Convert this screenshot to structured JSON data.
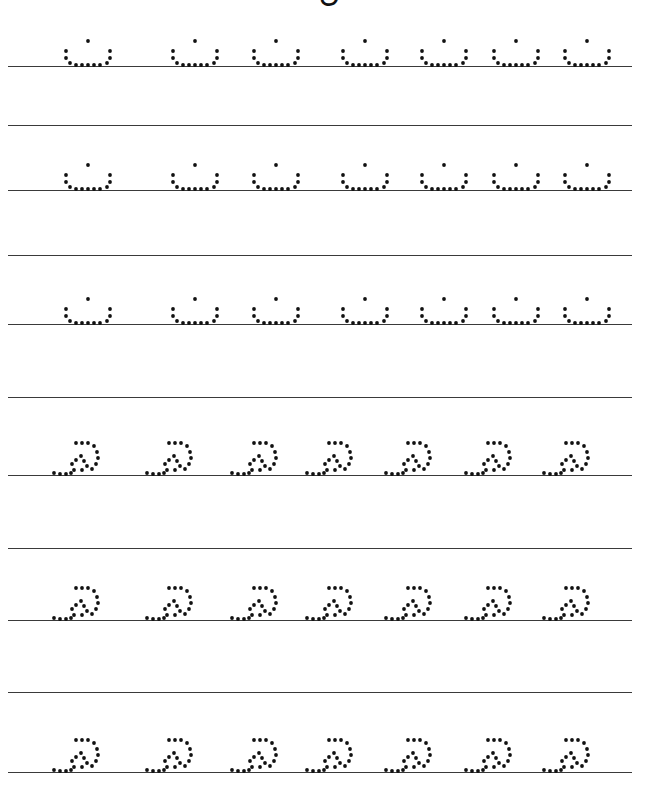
{
  "worksheet": {
    "title": "ن",
    "ink_color": "#111111",
    "rule_color": "#3a3a3a",
    "rule_lines_y": [
      66,
      125,
      190,
      255,
      324,
      397,
      475,
      548,
      620,
      692,
      772
    ],
    "rows": [
      {
        "glyph": "noon",
        "baseline_y": 66,
        "glyph_x": [
          62,
          169,
          250,
          339,
          418,
          490,
          561
        ]
      },
      {
        "glyph": "noon",
        "baseline_y": 190,
        "glyph_x": [
          62,
          169,
          250,
          339,
          418,
          490,
          561
        ]
      },
      {
        "glyph": "noon",
        "baseline_y": 324,
        "glyph_x": [
          62,
          169,
          250,
          339,
          418,
          490,
          561
        ]
      },
      {
        "glyph": "swirl",
        "baseline_y": 475,
        "glyph_x": [
          52,
          145,
          230,
          305,
          384,
          464,
          542
        ]
      },
      {
        "glyph": "swirl",
        "baseline_y": 620,
        "glyph_x": [
          52,
          145,
          230,
          305,
          384,
          464,
          542
        ]
      },
      {
        "glyph": "swirl",
        "baseline_y": 772,
        "glyph_x": [
          52,
          145,
          230,
          305,
          384,
          464,
          542
        ]
      }
    ]
  }
}
